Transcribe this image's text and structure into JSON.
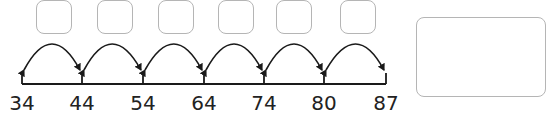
{
  "numberline": {
    "ticks": [
      "34",
      "44",
      "54",
      "64",
      "74",
      "80",
      "87"
    ],
    "tick_x": [
      22,
      82,
      143,
      204,
      264,
      324,
      386
    ],
    "jump_boxes": [
      "",
      "",
      "",
      "",
      "",
      ""
    ],
    "answer_box": ""
  },
  "colors": {
    "line": "#1a1a1a",
    "box_border": "#b5b5b5"
  }
}
